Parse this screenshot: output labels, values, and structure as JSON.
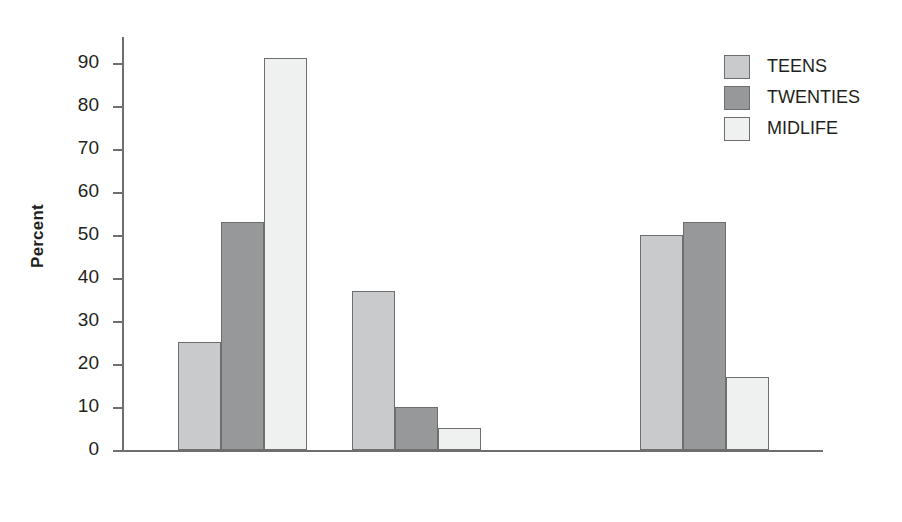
{
  "chart_data": {
    "type": "bar",
    "title": "",
    "subtitle": "",
    "xlabel": "",
    "ylabel": "Percent",
    "categories": [
      "Yes",
      "No",
      "Yes & no"
    ],
    "series": [
      {
        "name": "TEENS",
        "color": "#c9cacb",
        "values": [
          25,
          37,
          50
        ]
      },
      {
        "name": "TWENTIES",
        "color": "#96989a",
        "values": [
          53,
          10,
          53
        ]
      },
      {
        "name": "MIDLIFE",
        "color": "#eff0f0",
        "values": [
          91,
          5,
          17
        ]
      }
    ],
    "ylim": [
      0,
      95
    ],
    "ytick_values": [
      0,
      10,
      20,
      30,
      40,
      50,
      60,
      70,
      80,
      90
    ],
    "ytick_labels": [
      "0",
      "10",
      "20",
      "30",
      "40",
      "50",
      "60",
      "70",
      "80",
      "90"
    ],
    "grid": false,
    "legend_position": "top-right",
    "legend_entries": [
      "TEENS",
      "TWENTIES",
      "MIDLIFE"
    ],
    "axis_color": "#6d6e70",
    "bar_edge_color": "#6d6e70",
    "background_color": "#ffffff"
  }
}
